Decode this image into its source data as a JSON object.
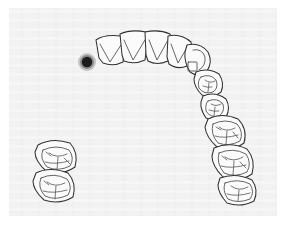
{
  "image": {
    "kind": "dental-arch-occlusal-diagram",
    "title": "Dental arch occlusal diagram",
    "background_color": "#ffffff",
    "panel_color": "#f2f2f2",
    "outline_color": "#333333",
    "inner_line_color": "#4a4a4a",
    "panel": {
      "x": 9,
      "y": 8,
      "width": 268,
      "height": 208
    }
  },
  "marker": {
    "name": "position-marker-dot",
    "color": "#1c1c1c",
    "halo_color": "#b4b4b4",
    "x": 87,
    "y": 62,
    "radius": 6
  },
  "arch": {
    "label": "maxillary-arch",
    "teeth": [
      {
        "id": "anterior-1",
        "type": "incisor",
        "marking": "v-shape",
        "cx": 110,
        "cy": 48
      },
      {
        "id": "anterior-2",
        "type": "incisor",
        "marking": "v-shape",
        "cx": 131,
        "cy": 43
      },
      {
        "id": "anterior-3",
        "type": "incisor",
        "marking": "v-shape",
        "cx": 155,
        "cy": 43
      },
      {
        "id": "anterior-4",
        "type": "incisor",
        "marking": "v-shape",
        "cx": 177,
        "cy": 49
      },
      {
        "id": "canine-r",
        "type": "canine",
        "marking": "square-notch",
        "cx": 198,
        "cy": 58
      },
      {
        "id": "premolar-r1",
        "type": "premolar",
        "marking": "cusp-pattern",
        "cx": 210,
        "cy": 83
      },
      {
        "id": "premolar-r2",
        "type": "premolar",
        "marking": "cusp-pattern",
        "cx": 217,
        "cy": 106
      },
      {
        "id": "molar-r1",
        "type": "molar",
        "marking": "fissure-pattern",
        "cx": 228,
        "cy": 131
      },
      {
        "id": "molar-r2",
        "type": "molar",
        "marking": "fissure-pattern",
        "cx": 238,
        "cy": 162
      },
      {
        "id": "molar-r3",
        "type": "molar",
        "marking": "fissure-pattern",
        "cx": 243,
        "cy": 190
      }
    ]
  },
  "isolated_segment": {
    "label": "left-molar-segment",
    "teeth": [
      {
        "id": "molar-l1",
        "type": "molar",
        "marking": "fissure-pattern",
        "cx": 57,
        "cy": 158
      },
      {
        "id": "molar-l2",
        "type": "molar",
        "marking": "fissure-pattern",
        "cx": 55,
        "cy": 188
      }
    ]
  }
}
